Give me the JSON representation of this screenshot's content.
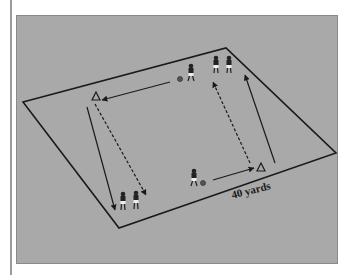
{
  "diagram": {
    "field_label": "40 yards",
    "colors": {
      "background": "#a9a9a9",
      "lines": "#1a1a1a",
      "page": "#ffffff"
    },
    "elements": {
      "cones": [
        {
          "name": "cone-top-left",
          "x": 96,
          "y": 97
        },
        {
          "name": "cone-bottom-right",
          "x": 261,
          "y": 168
        }
      ],
      "players": [
        {
          "name": "player-dribbler-top",
          "x": 191,
          "y": 72,
          "with_ball": true
        },
        {
          "name": "player-queue-top-1",
          "x": 216,
          "y": 63
        },
        {
          "name": "player-queue-top-2",
          "x": 229,
          "y": 63
        },
        {
          "name": "player-dribbler-bottom",
          "x": 193,
          "y": 178,
          "with_ball": true
        },
        {
          "name": "player-queue-bottom-1",
          "x": 123,
          "y": 205
        },
        {
          "name": "player-queue-bottom-2",
          "x": 136,
          "y": 205
        }
      ],
      "arrows": [
        {
          "name": "pass-arrow-top",
          "style": "solid",
          "from": [
            170,
            82
          ],
          "to": [
            102,
            100
          ]
        },
        {
          "name": "dribble-arrow-left",
          "style": "solid",
          "from": [
            87,
            107
          ],
          "to": [
            115,
            210
          ]
        },
        {
          "name": "run-arrow-left",
          "style": "dashed",
          "from": [
            95,
            104
          ],
          "to": [
            146,
            195
          ]
        },
        {
          "name": "pass-arrow-bottom",
          "style": "solid",
          "from": [
            213,
            180
          ],
          "to": [
            254,
            168
          ]
        },
        {
          "name": "dribble-arrow-right",
          "style": "solid",
          "from": [
            275,
            163
          ],
          "to": [
            245,
            75
          ]
        },
        {
          "name": "run-arrow-right",
          "style": "dashed",
          "from": [
            250,
            163
          ],
          "to": [
            213,
            82
          ]
        }
      ]
    }
  }
}
